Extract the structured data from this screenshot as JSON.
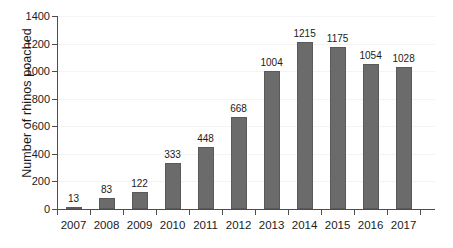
{
  "chart_data": {
    "type": "bar",
    "title": "",
    "xlabel": "",
    "ylabel": "Number of rhinos poached",
    "categories": [
      "2007",
      "2008",
      "2009",
      "2010",
      "2011",
      "2012",
      "2013",
      "2014",
      "2015",
      "2016",
      "2017"
    ],
    "values": [
      13,
      83,
      122,
      333,
      448,
      668,
      1004,
      1215,
      1175,
      1054,
      1028
    ],
    "value_labels": [
      "13",
      "83",
      "122",
      "333",
      "448",
      "668",
      "1004",
      "1215",
      "1175",
      "1054",
      "1028"
    ],
    "ylim": [
      0,
      1400
    ],
    "y_ticks": [
      0,
      200,
      400,
      600,
      800,
      1000,
      1200,
      1400
    ],
    "y_tick_labels": [
      "0",
      "200",
      "400",
      "600",
      "800",
      "1000",
      "1200",
      "1400"
    ],
    "grid": true,
    "legend": "none",
    "bar_color": "#6b6b6b",
    "bar_edge_color": "#5a5a5a",
    "axis_color": "#4d4d4d",
    "text_color": "#1b1b1b",
    "background": "#ffffff"
  }
}
